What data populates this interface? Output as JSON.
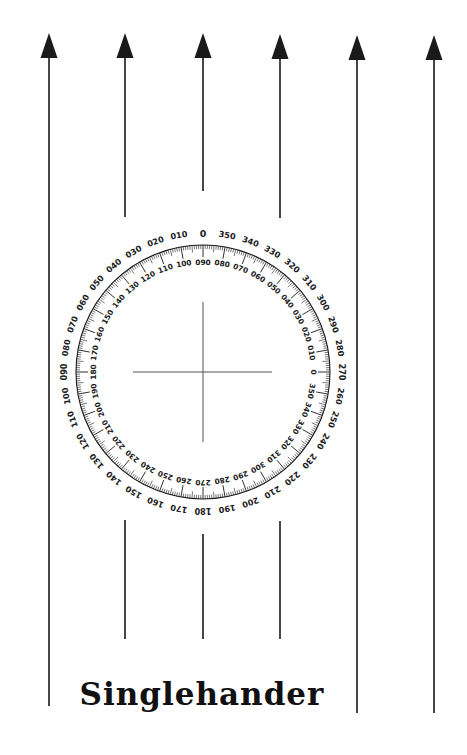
{
  "title": "Singlehander",
  "colors": {
    "ink": "#1a1a1a",
    "background": "#ffffff",
    "crosshair": "#555555"
  },
  "arrows": [
    {
      "x": 49,
      "tip_y": 33,
      "head_base_y": 58,
      "segments": [
        [
          58,
          706
        ]
      ]
    },
    {
      "x": 125,
      "tip_y": 33,
      "head_base_y": 58,
      "segments": [
        [
          58,
          217
        ],
        [
          520,
          639
        ]
      ]
    },
    {
      "x": 203,
      "tip_y": 33,
      "head_base_y": 58,
      "segments": [
        [
          58,
          191
        ],
        [
          534,
          639
        ]
      ]
    },
    {
      "x": 280,
      "tip_y": 34,
      "head_base_y": 59,
      "segments": [
        [
          59,
          218
        ],
        [
          521,
          639
        ]
      ]
    },
    {
      "x": 357,
      "tip_y": 35,
      "head_base_y": 60,
      "segments": [
        [
          60,
          713
        ]
      ]
    },
    {
      "x": 434,
      "tip_y": 35,
      "head_base_y": 60,
      "segments": [
        [
          60,
          713
        ]
      ]
    }
  ],
  "compass": {
    "center": [
      203,
      372
    ],
    "ring_radius": 127,
    "outer_label_radius": 139,
    "inner_label_radius": 110,
    "outer_labels": {
      "start_at_top": "0",
      "direction": "counterclockwise-increasing",
      "values": [
        "0",
        "010",
        "020",
        "030",
        "040",
        "050",
        "060",
        "070",
        "080",
        "090",
        "100",
        "110",
        "120",
        "130",
        "140",
        "150",
        "160",
        "170",
        "180",
        "190",
        "200",
        "210",
        "220",
        "230",
        "240",
        "250",
        "260",
        "270",
        "280",
        "290",
        "300",
        "310",
        "320",
        "330",
        "340",
        "350"
      ]
    },
    "inner_labels": {
      "start_at_top": "090",
      "direction": "counterclockwise-increasing",
      "values": [
        "090",
        "100",
        "110",
        "120",
        "130",
        "140",
        "150",
        "160",
        "170",
        "180",
        "190",
        "200",
        "210",
        "220",
        "230",
        "240",
        "250",
        "260",
        "270",
        "280",
        "290",
        "300",
        "310",
        "320",
        "330",
        "340",
        "350",
        "0",
        "010",
        "020",
        "030",
        "040",
        "050",
        "060",
        "070",
        "080"
      ]
    },
    "crosshair": {
      "horizontal": [
        133,
        272
      ],
      "vertical": [
        302,
        442
      ]
    }
  }
}
